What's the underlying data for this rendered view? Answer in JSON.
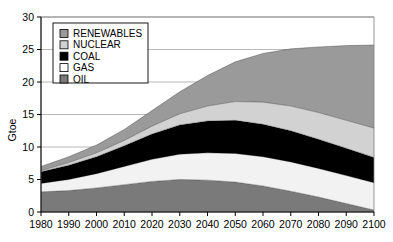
{
  "chart_data": {
    "type": "area",
    "stacked": true,
    "title": "",
    "subtitle": "",
    "xlabel": "",
    "ylabel": "Gtoe",
    "x": [
      1980,
      1990,
      2000,
      2010,
      2020,
      2030,
      2040,
      2050,
      2060,
      2070,
      2080,
      2090,
      2100
    ],
    "categories": [
      "1980",
      "1990",
      "2000",
      "2010",
      "2020",
      "2030",
      "2040",
      "2050",
      "2060",
      "2070",
      "2080",
      "2090",
      "2100"
    ],
    "xlim": [
      1980,
      2100
    ],
    "ylim": [
      0,
      30
    ],
    "ytick_values": [
      0,
      5,
      10,
      15,
      20,
      25,
      30
    ],
    "ytick_labels": [
      "0",
      "5",
      "10",
      "15",
      "20",
      "25",
      "30"
    ],
    "xtick_labels": [
      "1980",
      "1990",
      "2000",
      "2010",
      "2020",
      "2030",
      "2040",
      "2050",
      "2060",
      "2070",
      "2080",
      "2090",
      "2100"
    ],
    "grid": true,
    "grid_axis": "y",
    "legend_position": "top-left",
    "stack_order_bottom_to_top": [
      "OIL",
      "GAS",
      "COAL",
      "NUCLEAR",
      "RENEWABLES"
    ],
    "series": [
      {
        "name": "OIL",
        "color": "#7a7a7a",
        "values": [
          3.1,
          3.3,
          3.7,
          4.2,
          4.7,
          5.0,
          4.9,
          4.6,
          4.0,
          3.2,
          2.3,
          1.3,
          0.3
        ]
      },
      {
        "name": "GAS",
        "color": "#f2f2f2",
        "values": [
          1.3,
          1.7,
          2.2,
          2.8,
          3.4,
          3.9,
          4.2,
          4.4,
          4.5,
          4.5,
          4.4,
          4.3,
          4.2
        ]
      },
      {
        "name": "COAL",
        "color": "#000000",
        "values": [
          1.8,
          2.2,
          2.6,
          3.2,
          3.9,
          4.5,
          4.9,
          5.1,
          5.0,
          4.8,
          4.5,
          4.2,
          3.9
        ]
      },
      {
        "name": "NUCLEAR",
        "color": "#d2d2d2",
        "values": [
          0.15,
          0.4,
          0.6,
          0.8,
          1.2,
          1.7,
          2.3,
          2.9,
          3.4,
          3.8,
          4.1,
          4.3,
          4.5
        ]
      },
      {
        "name": "RENEWABLES",
        "color": "#9a9a9a",
        "values": [
          0.65,
          0.9,
          1.2,
          1.7,
          2.4,
          3.4,
          4.7,
          6.1,
          7.5,
          8.8,
          10.1,
          11.5,
          12.8
        ]
      }
    ],
    "totals": [
      7.0,
      8.5,
      10.3,
      12.7,
      15.6,
      18.5,
      21.0,
      23.1,
      24.4,
      25.1,
      25.4,
      25.6,
      25.7
    ]
  },
  "legend": {
    "entries": [
      {
        "label": "RENEWABLES",
        "color": "#9a9a9a"
      },
      {
        "label": "NUCLEAR",
        "color": "#d2d2d2"
      },
      {
        "label": "COAL",
        "color": "#000000"
      },
      {
        "label": "GAS",
        "color": "#ffffff"
      },
      {
        "label": "OIL",
        "color": "#7a7a7a"
      }
    ]
  },
  "axes": {
    "y_title": "Gtoe"
  },
  "colors": {
    "background": "#ffffff",
    "grid": "#9a9a9a",
    "axis": "#000000",
    "oil": "#7a7a7a",
    "gas": "#f2f2f2",
    "coal": "#000000",
    "nuclear": "#d2d2d2",
    "renewables": "#9a9a9a"
  }
}
